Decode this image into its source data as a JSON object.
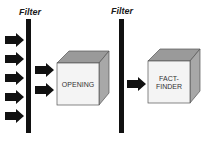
{
  "diagram": {
    "filters": [
      {
        "label": "Filter"
      },
      {
        "label": "Filter"
      }
    ],
    "stages": [
      {
        "label_lines": [
          "OPENING"
        ]
      },
      {
        "label_lines": [
          "FACT-",
          "FINDER"
        ]
      }
    ],
    "arrows": {
      "input_count": 5,
      "after_filter_1_count": 2,
      "after_filter_2_count": 1
    },
    "colors": {
      "arrow": "#111111",
      "bar": "#111111",
      "cube_front": "#f4f4f4",
      "cube_top": "#9a9a9a",
      "cube_side": "#a8a8a8"
    }
  }
}
